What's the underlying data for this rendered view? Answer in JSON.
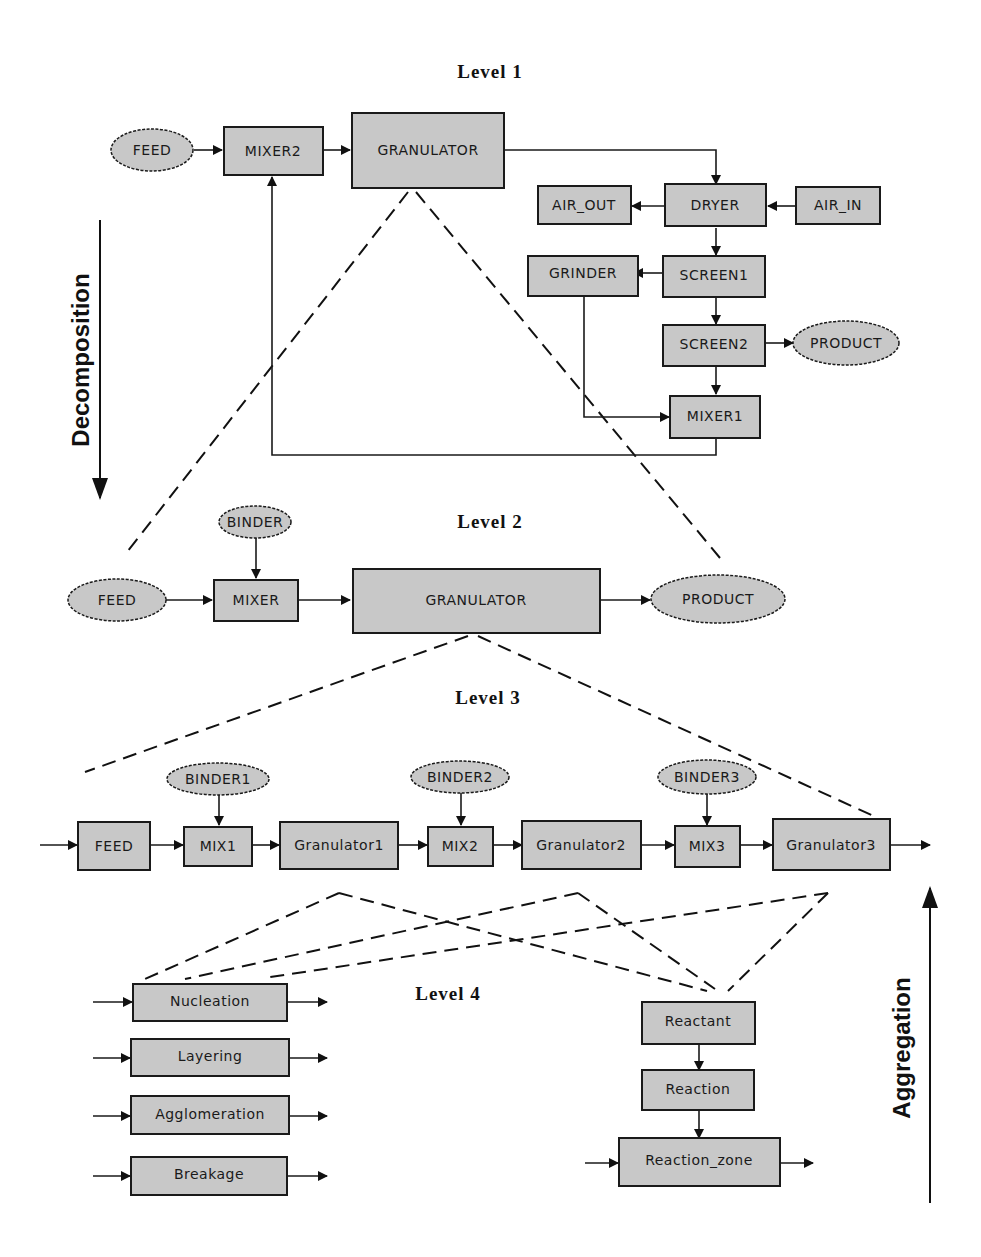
{
  "levels": {
    "l1": "Level 1",
    "l2": "Level 2",
    "l3": "Level 3",
    "l4": "Level 4"
  },
  "axes": {
    "decomposition": "Decomposition",
    "aggregation": "Aggregation"
  },
  "level1": {
    "feed": "FEED",
    "mixer2": "MIXER2",
    "granulator": "GRANULATOR",
    "air_out": "AIR_OUT",
    "dryer": "DRYER",
    "air_in": "AIR_IN",
    "grinder": "GRINDER",
    "screen1": "SCREEN1",
    "screen2": "SCREEN2",
    "product": "PRODUCT",
    "mixer1": "MIXER1"
  },
  "level2": {
    "binder": "BINDER",
    "feed": "FEED",
    "mixer": "MIXER",
    "granulator": "GRANULATOR",
    "product": "PRODUCT"
  },
  "level3": {
    "binder1": "BINDER1",
    "binder2": "BINDER2",
    "binder3": "BINDER3",
    "feed": "FEED",
    "mix1": "MIX1",
    "granulator1": "Granulator1",
    "mix2": "MIX2",
    "granulator2": "Granulator2",
    "mix3": "MIX3",
    "granulator3": "Granulator3"
  },
  "level4": {
    "nucleation": "Nucleation",
    "layering": "Layering",
    "agglomeration": "Agglomeration",
    "breakage": "Breakage",
    "reactant": "Reactant",
    "reaction": "Reaction",
    "reaction_zone": "Reaction_zone"
  }
}
